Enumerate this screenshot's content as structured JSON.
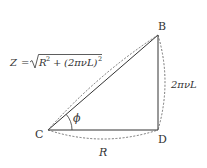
{
  "diagram": {
    "type": "impedance-triangle",
    "vertices": [
      {
        "id": "B",
        "label": "B",
        "x": 158,
        "y": 35
      },
      {
        "id": "C",
        "label": "C",
        "x": 48,
        "y": 130
      },
      {
        "id": "D",
        "label": "D",
        "x": 158,
        "y": 130
      }
    ],
    "edges": [
      {
        "from": "C",
        "to": "B",
        "label": "Z = √(R² + (2πνL)²)",
        "style": "solid"
      },
      {
        "from": "B",
        "to": "D",
        "label": "2πνL",
        "style": "solid"
      },
      {
        "from": "C",
        "to": "D",
        "label": "R",
        "style": "solid"
      }
    ],
    "angle": {
      "vertex": "C",
      "label": "ϕ"
    },
    "labels": {
      "vertex_b": "B",
      "vertex_c": "C",
      "vertex_d": "D",
      "angle_phi": "ϕ",
      "side_r": "R",
      "side_reactance": "2πνL",
      "hyp_z": "Z",
      "hyp_eq": "=",
      "hyp_r": "R",
      "hyp_r_exp": "2",
      "hyp_plus": "+",
      "hyp_paren_open": "(2πνL)",
      "hyp_paren_exp": "2"
    },
    "colors": {
      "line": "#333333",
      "dashed": "#555555",
      "text": "#333333",
      "background": "#ffffff"
    }
  }
}
